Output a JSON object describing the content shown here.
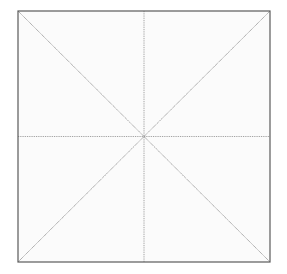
{
  "canvas": {
    "width": 287,
    "height": 274,
    "background_color": "#ffffff"
  },
  "figure": {
    "name": "square-with-diagonals-and-medians",
    "fill_color": "#fbfbfb",
    "border_color": "#5a5a5a",
    "border_width": 1.2,
    "line_color": "#8c8c8c",
    "line_width": 0.9,
    "line_style": "dotted",
    "bounds": {
      "left": 18,
      "top": 11,
      "right": 270,
      "bottom": 262,
      "width": 252,
      "height": 251
    },
    "center": {
      "x": 144,
      "y": 136.5
    },
    "corners": [
      {
        "name": "top-left",
        "x": 18,
        "y": 11
      },
      {
        "name": "top-right",
        "x": 270,
        "y": 11
      },
      {
        "name": "bottom-right",
        "x": 270,
        "y": 262
      },
      {
        "name": "bottom-left",
        "x": 18,
        "y": 262
      }
    ],
    "lines": [
      {
        "name": "diagonal-tl-br",
        "x1": 18,
        "y1": 11,
        "x2": 270,
        "y2": 262
      },
      {
        "name": "diagonal-tr-bl",
        "x1": 270,
        "y1": 11,
        "x2": 18,
        "y2": 262
      },
      {
        "name": "median-horizontal",
        "x1": 18,
        "y1": 136.5,
        "x2": 270,
        "y2": 136.5
      },
      {
        "name": "median-vertical",
        "x1": 144,
        "y1": 11,
        "x2": 144,
        "y2": 262
      }
    ]
  }
}
